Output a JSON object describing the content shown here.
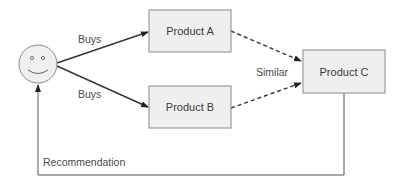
{
  "diagram": {
    "nodes": {
      "user": {
        "icon": "smiley-face-icon",
        "label": ""
      },
      "product_a": {
        "label": "Product A"
      },
      "product_b": {
        "label": "Product B"
      },
      "product_c": {
        "label": "Product C"
      }
    },
    "edges": {
      "buys_a": {
        "from": "user",
        "to": "product_a",
        "label": "Buys",
        "style": "solid"
      },
      "buys_b": {
        "from": "user",
        "to": "product_b",
        "label": "Buys",
        "style": "solid"
      },
      "similar_a": {
        "from": "product_a",
        "to": "product_c",
        "style": "dashed"
      },
      "similar_b": {
        "from": "product_b",
        "to": "product_c",
        "style": "dashed"
      },
      "recommendation": {
        "from": "product_c",
        "to": "user",
        "label": "Recommendation",
        "style": "solid"
      }
    },
    "similar_label": "Similar",
    "colors": {
      "box_fill": "#efefef",
      "box_stroke": "#8a8a8a",
      "arrow": "#333333",
      "text": "#3a3a3a"
    }
  }
}
